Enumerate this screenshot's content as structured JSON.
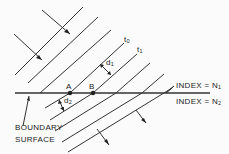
{
  "diagram": {
    "type": "wavefront refraction at boundary",
    "labels": {
      "t0": "t",
      "t0_sub": "0",
      "t1": "t",
      "t1_sub": "1",
      "d1": "d",
      "d1_sub": "1",
      "d2": "d",
      "d2_sub": "2",
      "point_a": "A",
      "point_b": "B",
      "index_n1": "INDEX = N",
      "index_n1_sub": "1",
      "index_n2": "INDEX = N",
      "index_n2_sub": "2",
      "boundary_line1": "BOUNDARY",
      "boundary_line2": "SURFACE"
    },
    "colors": {
      "line": "#333333",
      "background": "#fbfbfb"
    }
  }
}
